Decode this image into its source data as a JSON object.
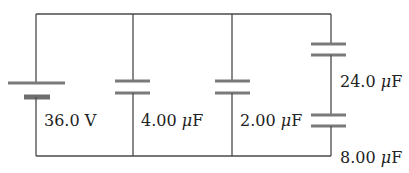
{
  "diagram": {
    "type": "circuit",
    "colors": {
      "wire": "#4a4a4a",
      "plate": "#7a7a7a",
      "text": "#222222",
      "background": "#ffffff"
    },
    "battery": {
      "label": "36.0 V",
      "voltage": 36.0,
      "unit": "V"
    },
    "capacitors": [
      {
        "id": "c1",
        "label": "4.00 μF",
        "value_num": "4.00",
        "unit": "μF",
        "branch": "parallel-1"
      },
      {
        "id": "c2",
        "label": "2.00 μF",
        "value_num": "2.00",
        "unit": "μF",
        "branch": "parallel-2"
      },
      {
        "id": "c3",
        "label": "24.0 μF",
        "value_num": "24.0",
        "unit": "μF",
        "branch": "series-top"
      },
      {
        "id": "c4",
        "label": "8.00 μF",
        "value_num": "8.00",
        "unit": "μF",
        "branch": "series-bottom"
      }
    ],
    "labels": {
      "battery_num": "36.0 V",
      "c1_num": "4.00 ",
      "c2_num": "2.00 ",
      "c3_num": "24.0 ",
      "c4_num": "8.00 ",
      "mu": "μ",
      "farad": "F"
    }
  }
}
